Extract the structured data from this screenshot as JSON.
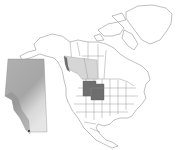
{
  "map": {
    "type": "range-map",
    "region": "North America",
    "colors": {
      "background": "#ffffff",
      "land": "#ffffff",
      "borders": "#9a9a9a",
      "range_light": "#d6d6d6",
      "range_dark": "#6e6e6e",
      "inset_base": "#b4b4b4",
      "inset_light": "#e2e2e2",
      "inset_dark": "#8e8e8e"
    },
    "highlighted_regions": [
      {
        "name": "light-range",
        "shade": "light"
      },
      {
        "name": "dark-range",
        "shade": "dark"
      }
    ],
    "inset": {
      "name": "province-inset",
      "position": "left"
    }
  }
}
